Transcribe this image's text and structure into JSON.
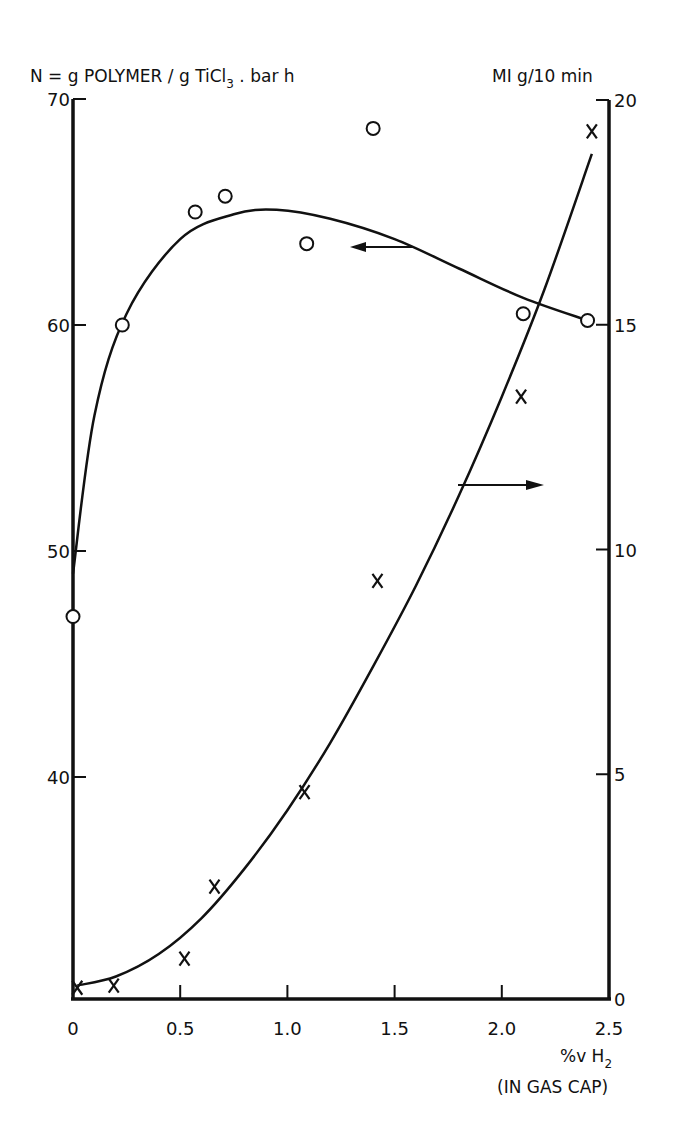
{
  "chart_data": {
    "type": "line",
    "title": "",
    "left_axis_title": "N = g POLYMER / g TiCl3 . bar h",
    "right_axis_title": "MI g/10 min",
    "xlabel": "%v H2",
    "xlabel_sub": "(IN GAS CAP)",
    "xlim": [
      0,
      2.5
    ],
    "ylim_left": [
      30,
      70
    ],
    "ylim_right": [
      0,
      20
    ],
    "x_ticks": [
      "0",
      "0.5",
      "1.0",
      "1.5",
      "2.0",
      "2.5"
    ],
    "y_left_ticks": [
      "40",
      "50",
      "60",
      "70"
    ],
    "y_right_ticks": [
      "0",
      "5",
      "10",
      "15",
      "20"
    ],
    "grid": false,
    "series": [
      {
        "name": "N (activity)",
        "axis": "left",
        "marker": "circle",
        "points": [
          {
            "x": 0.0,
            "y": 47.1
          },
          {
            "x": 0.23,
            "y": 60.0
          },
          {
            "x": 0.57,
            "y": 65.0
          },
          {
            "x": 0.71,
            "y": 65.7
          },
          {
            "x": 1.09,
            "y": 63.6
          },
          {
            "x": 1.4,
            "y": 68.7
          },
          {
            "x": 2.1,
            "y": 60.5
          },
          {
            "x": 2.4,
            "y": 60.2
          }
        ],
        "fit_curve": [
          {
            "x": 0.0,
            "y": 49.0
          },
          {
            "x": 0.1,
            "y": 56.0
          },
          {
            "x": 0.25,
            "y": 60.5
          },
          {
            "x": 0.5,
            "y": 63.8
          },
          {
            "x": 0.75,
            "y": 64.9
          },
          {
            "x": 0.95,
            "y": 65.1
          },
          {
            "x": 1.2,
            "y": 64.7
          },
          {
            "x": 1.5,
            "y": 63.8
          },
          {
            "x": 1.8,
            "y": 62.5
          },
          {
            "x": 2.1,
            "y": 61.2
          },
          {
            "x": 2.4,
            "y": 60.2
          }
        ],
        "arrow": "points-left"
      },
      {
        "name": "MI (melt index)",
        "axis": "right",
        "marker": "x",
        "points": [
          {
            "x": 0.02,
            "y": 0.25
          },
          {
            "x": 0.19,
            "y": 0.3
          },
          {
            "x": 0.52,
            "y": 0.9
          },
          {
            "x": 0.66,
            "y": 2.5
          },
          {
            "x": 1.08,
            "y": 4.6
          },
          {
            "x": 1.42,
            "y": 9.3
          },
          {
            "x": 2.09,
            "y": 13.4
          },
          {
            "x": 2.42,
            "y": 19.3
          }
        ],
        "fit_curve": [
          {
            "x": 0.02,
            "y": 0.3
          },
          {
            "x": 0.2,
            "y": 0.5
          },
          {
            "x": 0.4,
            "y": 1.0
          },
          {
            "x": 0.6,
            "y": 1.8
          },
          {
            "x": 0.8,
            "y": 2.9
          },
          {
            "x": 1.0,
            "y": 4.2
          },
          {
            "x": 1.2,
            "y": 5.7
          },
          {
            "x": 1.4,
            "y": 7.4
          },
          {
            "x": 1.6,
            "y": 9.2
          },
          {
            "x": 1.8,
            "y": 11.2
          },
          {
            "x": 2.0,
            "y": 13.4
          },
          {
            "x": 2.2,
            "y": 15.8
          },
          {
            "x": 2.42,
            "y": 18.8
          }
        ],
        "arrow": "points-right"
      }
    ]
  },
  "labels": {
    "left_title_pre": "N =  g POLYMER / g TiCl",
    "left_title_sub": "3",
    "left_title_post": " .  bar h",
    "right_title": "MI  g/10 min",
    "x_title": "%v H",
    "x_title_sub": "2",
    "x_title_note": "(IN GAS CAP)"
  }
}
